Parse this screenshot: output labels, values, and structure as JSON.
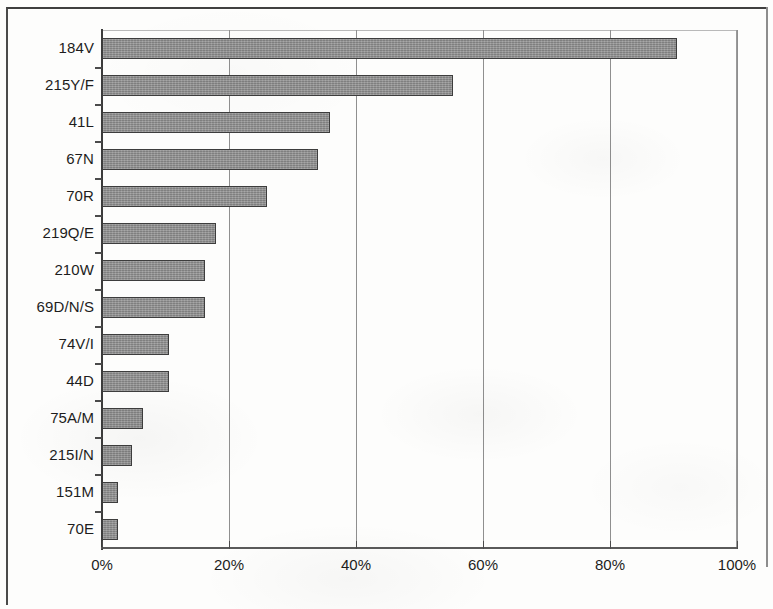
{
  "chart_data": {
    "type": "bar",
    "orientation": "horizontal",
    "title": "",
    "subtitle": "",
    "xlabel": "",
    "ylabel": "",
    "xlim": [
      0,
      100
    ],
    "xunit": "%",
    "grid": true,
    "legend": null,
    "xticks": [
      "0%",
      "20%",
      "40%",
      "60%",
      "80%",
      "100%"
    ],
    "xtick_values": [
      0,
      20,
      40,
      60,
      80,
      100
    ],
    "categories": [
      "184V",
      "215Y/F",
      "41L",
      "67N",
      "70R",
      "219Q/E",
      "210W",
      "69D/N/S",
      "74V/I",
      "44D",
      "75A/M",
      "215I/N",
      "151M",
      "70E"
    ],
    "values": [
      90.5,
      55.3,
      35.9,
      34.0,
      26.0,
      18.0,
      16.2,
      16.2,
      10.5,
      10.5,
      6.5,
      4.7,
      2.5,
      2.5
    ],
    "series": [
      {
        "name": "Frequency",
        "values": [
          90.5,
          55.3,
          35.9,
          34.0,
          26.0,
          18.0,
          16.2,
          16.2,
          10.5,
          10.5,
          6.5,
          4.7,
          2.5,
          2.5
        ]
      }
    ],
    "bar_color": "#8b8b8b",
    "bar_border_color": "#3d3d3d",
    "axis_color": "#3c3c3c",
    "gridline_color": "#8f8f8f",
    "background_color": "#fdfdfc"
  }
}
